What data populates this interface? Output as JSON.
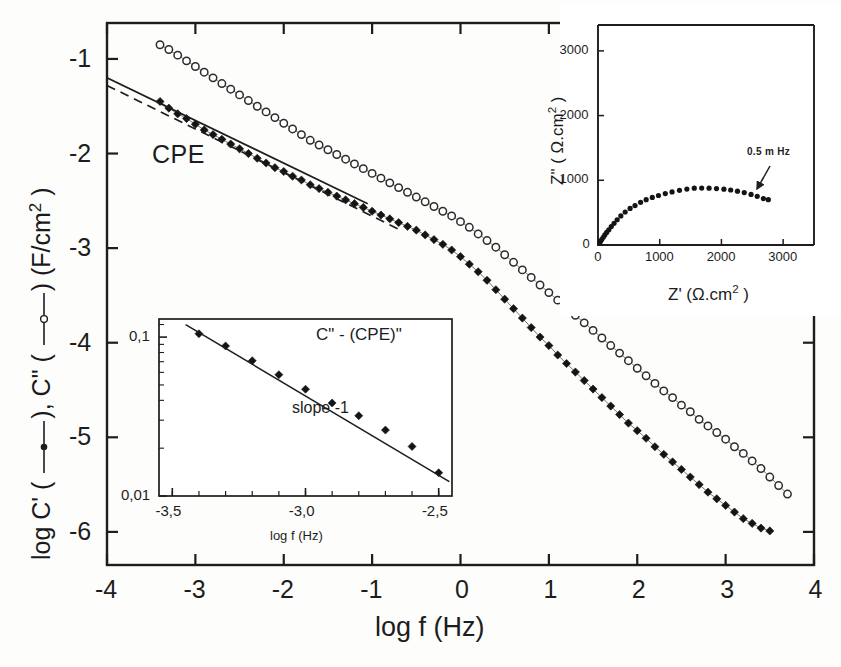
{
  "figure": {
    "background": "#fdfdfc",
    "ink": "#1d1d1d"
  },
  "main_axes": {
    "x_label": "log f (Hz)",
    "x_ticks": [
      "-4",
      "-3",
      "-2",
      "-1",
      "0",
      "1",
      "2",
      "3",
      "4"
    ],
    "y_ticks": [
      "-1",
      "-2",
      "-3",
      "-4",
      "-5",
      "-6"
    ],
    "y_label_parts": {
      "p1": "log C' (",
      "p2": "), C\" (",
      "p3": ") (F/cm",
      "sup": "2",
      "p4": " )"
    },
    "annotation_cpe": "CPE"
  },
  "inset_cpe": {
    "title": "C\" - (CPE)\"",
    "note": "slope -1",
    "x_label": "log f (Hz)",
    "x_ticks": [
      "-3,5",
      "-3,0",
      "-2,5"
    ],
    "y_ticks": [
      "0,1",
      "0,01"
    ]
  },
  "inset_nyquist": {
    "x_label_parts": {
      "p1": "Z' (",
      "omega": "Ω",
      "p2": ".cm",
      "sup": "2",
      "p3": " )"
    },
    "y_label_parts": {
      "p1": "Z\" ( ",
      "omega": "Ω",
      "p2": ".cm",
      "sup": "2",
      "p3": " )"
    },
    "x_ticks": [
      "0",
      "1000",
      "2000",
      "3000"
    ],
    "y_ticks": [
      "0",
      "1000",
      "2000",
      "3000"
    ],
    "annotation_frequency": "0.5 m Hz"
  },
  "chart_data": [
    {
      "id": "main",
      "type": "scatter",
      "title": "",
      "xlabel": "log f (Hz)",
      "ylabel": "log C' (filled circle line), C\" (open circle line) (F/cm^2)",
      "xlim": [
        -4,
        4
      ],
      "ylim": [
        -6.35,
        -0.62
      ],
      "grid": false,
      "legend": "inline-in-axis-label",
      "annotations": [
        {
          "text": "CPE",
          "x": -2.55,
          "y": -2.02
        }
      ],
      "series": [
        {
          "name": "C'",
          "marker": "filled-diamond",
          "color": "#141414",
          "points": [
            [
              -3.4,
              -1.45
            ],
            [
              -3.3,
              -1.52
            ],
            [
              -3.2,
              -1.58
            ],
            [
              -3.1,
              -1.63
            ],
            [
              -3.0,
              -1.69
            ],
            [
              -2.9,
              -1.75
            ],
            [
              -2.8,
              -1.8
            ],
            [
              -2.7,
              -1.85
            ],
            [
              -2.6,
              -1.9
            ],
            [
              -2.5,
              -1.95
            ],
            [
              -2.4,
              -2.0
            ],
            [
              -2.3,
              -2.05
            ],
            [
              -2.2,
              -2.1
            ],
            [
              -2.1,
              -2.15
            ],
            [
              -2.0,
              -2.19
            ],
            [
              -1.9,
              -2.24
            ],
            [
              -1.8,
              -2.28
            ],
            [
              -1.7,
              -2.33
            ],
            [
              -1.6,
              -2.37
            ],
            [
              -1.5,
              -2.41
            ],
            [
              -1.4,
              -2.45
            ],
            [
              -1.3,
              -2.49
            ],
            [
              -1.2,
              -2.53
            ],
            [
              -1.1,
              -2.57
            ],
            [
              -1.0,
              -2.61
            ],
            [
              -0.9,
              -2.65
            ],
            [
              -0.8,
              -2.69
            ],
            [
              -0.7,
              -2.73
            ],
            [
              -0.6,
              -2.77
            ],
            [
              -0.5,
              -2.81
            ],
            [
              -0.4,
              -2.86
            ],
            [
              -0.3,
              -2.91
            ],
            [
              -0.2,
              -2.96
            ],
            [
              -0.1,
              -3.02
            ],
            [
              0.0,
              -3.09
            ],
            [
              0.1,
              -3.17
            ],
            [
              0.2,
              -3.25
            ],
            [
              0.3,
              -3.34
            ],
            [
              0.4,
              -3.44
            ],
            [
              0.5,
              -3.54
            ],
            [
              0.6,
              -3.64
            ],
            [
              0.7,
              -3.74
            ],
            [
              0.8,
              -3.84
            ],
            [
              0.9,
              -3.94
            ],
            [
              1.0,
              -4.03
            ],
            [
              1.1,
              -4.13
            ],
            [
              1.2,
              -4.22
            ],
            [
              1.3,
              -4.31
            ],
            [
              1.4,
              -4.4
            ],
            [
              1.5,
              -4.49
            ],
            [
              1.6,
              -4.58
            ],
            [
              1.7,
              -4.67
            ],
            [
              1.8,
              -4.76
            ],
            [
              1.9,
              -4.85
            ],
            [
              2.0,
              -4.93
            ],
            [
              2.1,
              -5.01
            ],
            [
              2.2,
              -5.1
            ],
            [
              2.3,
              -5.18
            ],
            [
              2.4,
              -5.26
            ],
            [
              2.5,
              -5.34
            ],
            [
              2.6,
              -5.42
            ],
            [
              2.7,
              -5.5
            ],
            [
              2.8,
              -5.58
            ],
            [
              2.9,
              -5.65
            ],
            [
              3.0,
              -5.72
            ],
            [
              3.1,
              -5.79
            ],
            [
              3.2,
              -5.86
            ],
            [
              3.3,
              -5.91
            ],
            [
              3.4,
              -5.96
            ],
            [
              3.5,
              -5.99
            ]
          ]
        },
        {
          "name": "C\"",
          "marker": "open-circle",
          "color": "#2b2b2b",
          "points": [
            [
              -3.4,
              -0.85
            ],
            [
              -3.3,
              -0.9
            ],
            [
              -3.2,
              -0.96
            ],
            [
              -3.1,
              -1.02
            ],
            [
              -3.0,
              -1.08
            ],
            [
              -2.9,
              -1.14
            ],
            [
              -2.8,
              -1.2
            ],
            [
              -2.7,
              -1.26
            ],
            [
              -2.6,
              -1.32
            ],
            [
              -2.5,
              -1.38
            ],
            [
              -2.4,
              -1.44
            ],
            [
              -2.3,
              -1.5
            ],
            [
              -2.2,
              -1.56
            ],
            [
              -2.1,
              -1.62
            ],
            [
              -2.0,
              -1.68
            ],
            [
              -1.9,
              -1.74
            ],
            [
              -1.8,
              -1.8
            ],
            [
              -1.7,
              -1.86
            ],
            [
              -1.6,
              -1.91
            ],
            [
              -1.5,
              -1.96
            ],
            [
              -1.4,
              -2.01
            ],
            [
              -1.3,
              -2.06
            ],
            [
              -1.2,
              -2.11
            ],
            [
              -1.1,
              -2.16
            ],
            [
              -1.0,
              -2.21
            ],
            [
              -0.9,
              -2.26
            ],
            [
              -0.8,
              -2.31
            ],
            [
              -0.7,
              -2.36
            ],
            [
              -0.6,
              -2.41
            ],
            [
              -0.5,
              -2.46
            ],
            [
              -0.4,
              -2.51
            ],
            [
              -0.3,
              -2.56
            ],
            [
              -0.2,
              -2.61
            ],
            [
              -0.1,
              -2.66
            ],
            [
              0.0,
              -2.72
            ],
            [
              0.1,
              -2.78
            ],
            [
              0.2,
              -2.85
            ],
            [
              0.3,
              -2.92
            ],
            [
              0.4,
              -2.99
            ],
            [
              0.5,
              -3.07
            ],
            [
              0.6,
              -3.15
            ],
            [
              0.7,
              -3.23
            ],
            [
              0.8,
              -3.31
            ],
            [
              0.9,
              -3.39
            ],
            [
              1.0,
              -3.47
            ],
            [
              1.1,
              -3.55
            ],
            [
              1.2,
              -3.63
            ],
            [
              1.3,
              -3.71
            ],
            [
              1.4,
              -3.79
            ],
            [
              1.5,
              -3.87
            ],
            [
              1.6,
              -3.95
            ],
            [
              1.7,
              -4.03
            ],
            [
              1.8,
              -4.11
            ],
            [
              1.9,
              -4.19
            ],
            [
              2.0,
              -4.27
            ],
            [
              2.1,
              -4.35
            ],
            [
              2.2,
              -4.43
            ],
            [
              2.3,
              -4.51
            ],
            [
              2.4,
              -4.58
            ],
            [
              2.5,
              -4.66
            ],
            [
              2.6,
              -4.73
            ],
            [
              2.7,
              -4.81
            ],
            [
              2.8,
              -4.88
            ],
            [
              2.9,
              -4.95
            ],
            [
              3.0,
              -5.02
            ],
            [
              3.1,
              -5.1
            ],
            [
              3.2,
              -5.17
            ],
            [
              3.3,
              -5.25
            ],
            [
              3.4,
              -5.33
            ],
            [
              3.5,
              -5.42
            ],
            [
              3.6,
              -5.51
            ],
            [
              3.7,
              -5.6
            ]
          ]
        },
        {
          "name": "CPE fit (solid)",
          "marker": "line-solid",
          "color": "#1d1d1d",
          "points": [
            [
              -4.0,
              -1.2
            ],
            [
              -1.05,
              -2.53
            ]
          ]
        },
        {
          "name": "CPE fit (dashed)",
          "marker": "line-dashed",
          "color": "#1d1d1d",
          "points": [
            [
              -4.0,
              -1.28
            ],
            [
              -0.7,
              -2.8
            ]
          ]
        }
      ]
    },
    {
      "id": "inset-cpe",
      "type": "scatter",
      "title": "C\" - (CPE)\"",
      "xlabel": "log f (Hz)",
      "ylabel": "",
      "xlim": [
        -3.55,
        -2.45
      ],
      "ylim_log": [
        0.01,
        0.13
      ],
      "yscale": "log",
      "grid": false,
      "annotations": [
        {
          "text": "slope -1",
          "x": -2.9,
          "y": 0.045
        }
      ],
      "series": [
        {
          "name": "C\" - (CPE)\"",
          "marker": "filled-diamond",
          "color": "#141414",
          "points": [
            [
              -3.4,
              0.105
            ],
            [
              -3.3,
              0.088
            ],
            [
              -3.2,
              0.071
            ],
            [
              -3.1,
              0.058
            ],
            [
              -3.0,
              0.047
            ],
            [
              -2.9,
              0.0385
            ],
            [
              -2.8,
              0.032
            ],
            [
              -2.7,
              0.026
            ],
            [
              -2.6,
              0.0205
            ],
            [
              -2.5,
              0.014
            ]
          ]
        },
        {
          "name": "slope -1 line",
          "marker": "line-solid",
          "color": "#1d1d1d",
          "points": [
            [
              -3.45,
              0.12
            ],
            [
              -2.46,
              0.0123
            ]
          ]
        }
      ]
    },
    {
      "id": "inset-nyquist",
      "type": "scatter",
      "title": "",
      "xlabel": "Z' (Ω.cm2)",
      "ylabel": "Z\" (Ω.cm2)",
      "xlim": [
        0,
        3500
      ],
      "ylim": [
        0,
        3400
      ],
      "grid": false,
      "annotations": [
        {
          "text": "0.5 m Hz",
          "x": 2750,
          "y": 1350
        }
      ],
      "series": [
        {
          "name": "Nyquist",
          "marker": "filled-circle",
          "color": "#141414",
          "points": [
            [
              20,
              25
            ],
            [
              40,
              55
            ],
            [
              60,
              85
            ],
            [
              85,
              120
            ],
            [
              110,
              155
            ],
            [
              140,
              195
            ],
            [
              175,
              235
            ],
            [
              215,
              285
            ],
            [
              260,
              335
            ],
            [
              310,
              390
            ],
            [
              370,
              450
            ],
            [
              440,
              510
            ],
            [
              520,
              565
            ],
            [
              600,
              610
            ],
            [
              690,
              660
            ],
            [
              780,
              700
            ],
            [
              880,
              735
            ],
            [
              980,
              765
            ],
            [
              1090,
              795
            ],
            [
              1200,
              820
            ],
            [
              1320,
              845
            ],
            [
              1440,
              865
            ],
            [
              1560,
              878
            ],
            [
              1680,
              880
            ],
            [
              1800,
              878
            ],
            [
              1920,
              872
            ],
            [
              2040,
              862
            ],
            [
              2150,
              850
            ],
            [
              2260,
              832
            ],
            [
              2370,
              810
            ],
            [
              2480,
              782
            ],
            [
              2580,
              752
            ],
            [
              2680,
              718
            ],
            [
              2760,
              700
            ]
          ]
        }
      ]
    }
  ]
}
